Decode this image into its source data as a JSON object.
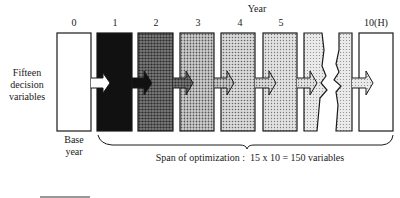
{
  "axis_title": "Year",
  "year_labels": [
    "0",
    "1",
    "2",
    "3",
    "4",
    "5",
    "10(H)"
  ],
  "left_label": [
    "Fifteen",
    "decision",
    "variables"
  ],
  "base_label": [
    "Base",
    "year"
  ],
  "span_label": "Span of optimization :  15 x 10 = 150 variables",
  "colors": {
    "stroke": "#1a1a1a",
    "year0": "#ffffff",
    "year1": "#111111",
    "year2": "#555555",
    "year3": "#a8a8a8",
    "year4": "#bdbdbd",
    "year5": "#cacaca",
    "year6": "#d6d6d6",
    "year9": "#dcdcdc",
    "year10": "#ffffff"
  }
}
